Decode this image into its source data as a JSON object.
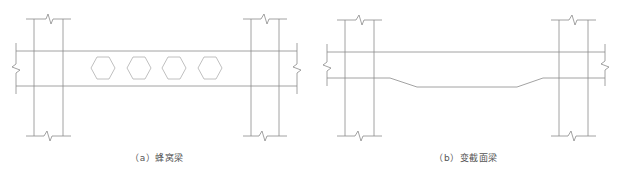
{
  "figures": [
    {
      "id": "a",
      "caption": "（a）蜂窝梁",
      "type": "castellated-beam",
      "hole_count": 4,
      "hole_shape": "hexagon"
    },
    {
      "id": "b",
      "caption": "（b）变截面梁",
      "type": "variable-section-beam",
      "haunch": "reduced-depth-midspan"
    }
  ],
  "colors": {
    "line": "#8a8a8a",
    "hole": "#b0b0b0",
    "caption": "#555555",
    "background": "#ffffff"
  }
}
